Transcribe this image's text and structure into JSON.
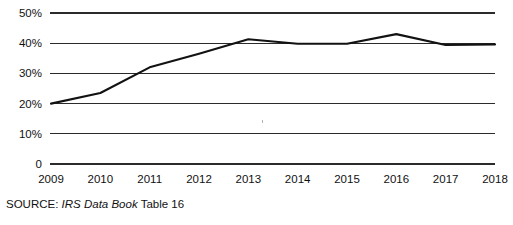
{
  "chart_data": {
    "type": "line",
    "title": "",
    "xlabel": "",
    "ylabel": "",
    "categories": [
      "2009",
      "2010",
      "2011",
      "2012",
      "2013",
      "2014",
      "2015",
      "2016",
      "2017",
      "2018"
    ],
    "x": [
      2009,
      2010,
      2011,
      2012,
      2013,
      2014,
      2015,
      2016,
      2017,
      2018
    ],
    "values": [
      20.0,
      23.5,
      32.0,
      36.5,
      41.3,
      39.8,
      39.8,
      43.0,
      39.4,
      39.6
    ],
    "series": [
      {
        "name": "",
        "values": [
          20.0,
          23.5,
          32.0,
          36.5,
          41.3,
          39.8,
          39.8,
          43.0,
          39.4,
          39.6
        ]
      }
    ],
    "ylim": [
      0,
      50
    ],
    "ytick_values": [
      0,
      10,
      20,
      30,
      40,
      50
    ],
    "ytick_labels": [
      "0",
      "10%",
      "20%",
      "30%",
      "40%",
      "50%"
    ],
    "xtick_labels": [
      "2009",
      "2010",
      "2011",
      "2012",
      "2013",
      "2014",
      "2015",
      "2016",
      "2017",
      "2018"
    ],
    "grid": true,
    "grid_axis": "y",
    "legend": false,
    "legend_position": "none",
    "line_color": "#121212",
    "grid_color": "#2b2b2b"
  },
  "source": {
    "prefix": "SOURCE: ",
    "emphasis": "IRS Data Book",
    "suffix": " Table 16",
    "full_text": "SOURCE: IRS Data Book Table 16"
  }
}
